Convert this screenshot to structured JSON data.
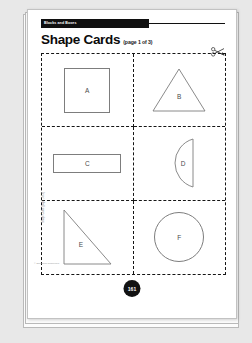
{
  "document": {
    "header_label": "Blocks and Boxes",
    "title": "Shape Cards",
    "subtitle": "(page 1 of 3)",
    "page_badge": "161",
    "margin_text": "Shape Cards (page 1 of 3)",
    "copyright": "© Education Resources",
    "cut_icon": "scissors-icon"
  },
  "cards": [
    {
      "letter": "A",
      "shape": "square"
    },
    {
      "letter": "B",
      "shape": "triangle"
    },
    {
      "letter": "C",
      "shape": "rectangle"
    },
    {
      "letter": "D",
      "shape": "semicircle"
    },
    {
      "letter": "E",
      "shape": "right-triangle"
    },
    {
      "letter": "F",
      "shape": "circle"
    }
  ],
  "colors": {
    "background": "#e8e8e8",
    "page": "#ffffff",
    "header_bar": "#101010",
    "shape_stroke": "#7d7d7d",
    "cut_line": "#151515",
    "badge": "#121212"
  }
}
